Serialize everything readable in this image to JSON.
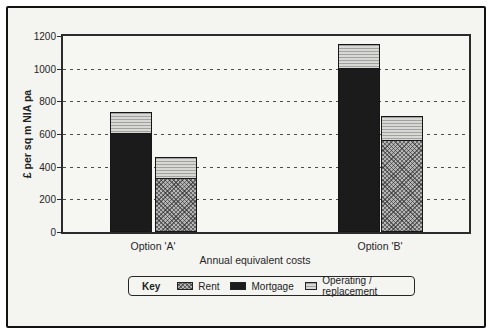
{
  "figure": {
    "background": "#f4f4f1",
    "frame_border_color": "#121212"
  },
  "chart_data": {
    "type": "bar",
    "stacked": true,
    "title": "",
    "xlabel": "Annual equivalent costs",
    "ylabel": "£ per sq m NIA pa",
    "ylim": [
      0,
      1200
    ],
    "yticks": [
      0,
      200,
      400,
      600,
      800,
      1000,
      1200
    ],
    "grid": "horizontal dashed lines at 200-1000",
    "categories": [
      "Option 'A'",
      "Option 'B'"
    ],
    "bars": [
      {
        "category": "Option 'A'",
        "stack": [
          {
            "series": "Mortgage",
            "value": 600
          },
          {
            "series": "Operating / replacement",
            "value": 130
          }
        ],
        "total": 730
      },
      {
        "category": "Option 'A'",
        "stack": [
          {
            "series": "Rent",
            "value": 325
          },
          {
            "series": "Operating / replacement",
            "value": 130
          }
        ],
        "total": 455
      },
      {
        "category": "Option 'B'",
        "stack": [
          {
            "series": "Mortgage",
            "value": 1000
          },
          {
            "series": "Operating / replacement",
            "value": 145
          }
        ],
        "total": 1145
      },
      {
        "category": "Option 'B'",
        "stack": [
          {
            "series": "Rent",
            "value": 555
          },
          {
            "series": "Operating / replacement",
            "value": 150
          }
        ],
        "total": 705
      }
    ],
    "legend": {
      "title": "Key",
      "position": "bottom",
      "entries": [
        {
          "label": "Rent",
          "pattern": "diagonal-crosshatch",
          "color": "#b5b5b5"
        },
        {
          "label": "Mortgage",
          "pattern": "solid",
          "color": "#1b1b1b"
        },
        {
          "label": "Operating / replacement",
          "pattern": "fine-horizontal-lines",
          "color": "#d8d8d5"
        }
      ]
    }
  }
}
